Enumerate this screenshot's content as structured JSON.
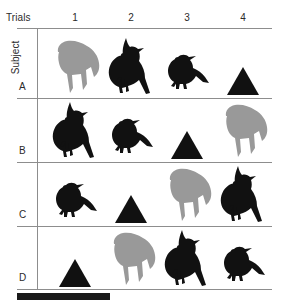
{
  "figure": {
    "axis_labels": {
      "columns_title": "Trials",
      "rows_title": "Subject"
    },
    "column_headers": [
      "1",
      "2",
      "3",
      "4"
    ],
    "row_headers": [
      "A",
      "B",
      "C",
      "D"
    ],
    "colors": {
      "silhouette_black": "#111111",
      "silhouette_gray": "#999999",
      "rule": "#8d8d8d",
      "background": "#ffffff",
      "scalebar": "#1a1a1a"
    },
    "stimuli_legend": {
      "parrot": "gray-parrot-silhouette",
      "cardinal": "black-crested-cardinal-silhouette",
      "sparrow": "black-small-bird-silhouette",
      "triangle": "black-triangle-shape"
    },
    "grid": [
      {
        "row": "A",
        "cells": [
          "parrot",
          "cardinal",
          "sparrow",
          "triangle"
        ]
      },
      {
        "row": "B",
        "cells": [
          "cardinal",
          "sparrow",
          "triangle",
          "parrot"
        ]
      },
      {
        "row": "C",
        "cells": [
          "sparrow",
          "triangle",
          "parrot",
          "cardinal"
        ]
      },
      {
        "row": "D",
        "cells": [
          "triangle",
          "parrot",
          "cardinal",
          "sparrow"
        ]
      }
    ],
    "scalebar": {
      "visible": true
    }
  }
}
